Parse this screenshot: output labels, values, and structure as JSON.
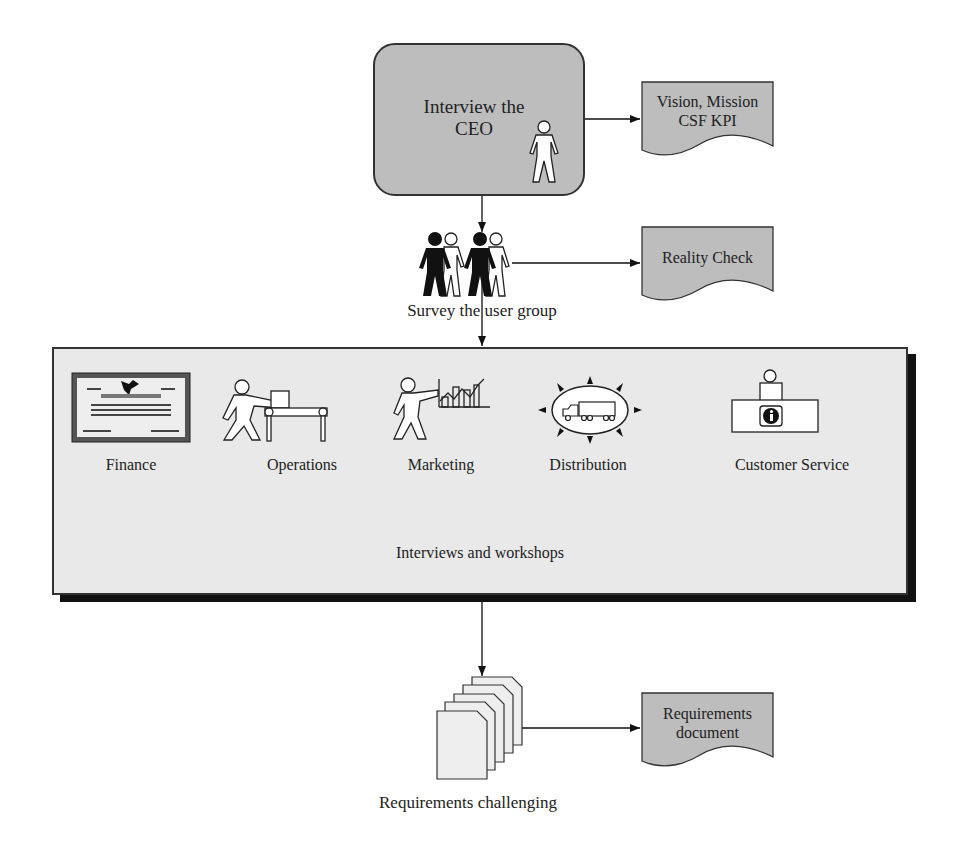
{
  "ceo_step": {
    "label": "Interview the CEO",
    "label_lines": [
      "Interview the",
      "CEO"
    ],
    "output_doc": {
      "lines": [
        "Vision, Mission",
        "CSF KPI"
      ]
    }
  },
  "survey_step": {
    "label": "Survey the user group",
    "output_doc": {
      "lines": [
        "Reality Check"
      ]
    }
  },
  "workshop_step": {
    "label": "Interviews and workshops",
    "departments": [
      {
        "label": "Finance",
        "icon": "certificate-icon"
      },
      {
        "label": "Operations",
        "icon": "conveyor-worker-icon"
      },
      {
        "label": "Marketing",
        "icon": "presenter-chart-icon"
      },
      {
        "label": "Distribution",
        "icon": "truck-distribution-icon"
      },
      {
        "label": "Customer Service",
        "icon": "info-desk-icon"
      }
    ]
  },
  "requirements_step": {
    "label": "Requirements challenging",
    "output_doc": {
      "lines": [
        "Requirements",
        "document"
      ]
    }
  },
  "colors": {
    "box_fill": "#bdbdbd",
    "panel_fill": "#e9e9e9",
    "stroke": "#333333",
    "shadow": "#111111"
  }
}
